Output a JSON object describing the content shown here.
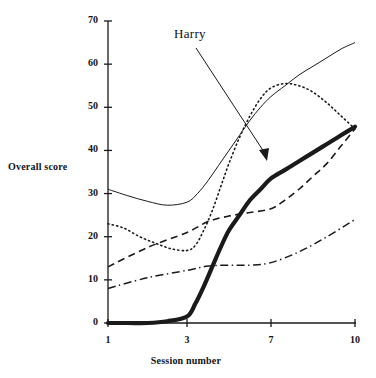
{
  "chart_data": {
    "type": "line",
    "title": "",
    "xlabel": "Session number",
    "ylabel": "Overall score",
    "xlim": [
      1,
      10
    ],
    "ylim": [
      0,
      70
    ],
    "grid": false,
    "legend": "none",
    "xticks": [
      1,
      3,
      7,
      10
    ],
    "xtick_labels": [
      "1",
      "3",
      "7",
      "10"
    ],
    "yticks": [
      0,
      10,
      20,
      30,
      40,
      50,
      60,
      70
    ],
    "ytick_labels": [
      "0",
      "10",
      "20",
      "30",
      "40",
      "50",
      "60",
      "70"
    ],
    "annotations": [
      {
        "text": "Harry",
        "points_to_series": "Harry",
        "x": 6.0,
        "y": 38
      }
    ],
    "series": [
      {
        "name": "Harry",
        "style": "thick-solid",
        "color": "#1a1a1a",
        "x": [
          1,
          1.5,
          2,
          2.5,
          3,
          3.4,
          3.8,
          4.2,
          4.6,
          5,
          5.5,
          6,
          6.5,
          7,
          7.5,
          8,
          8.5,
          9,
          9.5,
          10
        ],
        "y": [
          0,
          0,
          0,
          0.4,
          1.5,
          4.5,
          8.5,
          13,
          17.5,
          21.5,
          25,
          28.5,
          31,
          33.5,
          35.5,
          37.5,
          39.5,
          41.5,
          43.5,
          45.5
        ]
      },
      {
        "name": "series-thin-solid",
        "style": "thin-solid",
        "color": "#1a1a1a",
        "x": [
          1,
          1.5,
          2,
          2.5,
          3,
          3.5,
          4,
          4.5,
          5,
          5.5,
          6,
          6.5,
          7,
          7.5,
          8,
          8.5,
          9,
          9.5,
          10
        ],
        "y": [
          31,
          29.5,
          28.2,
          27.3,
          28,
          30,
          33,
          36.5,
          40,
          43.5,
          47,
          50,
          52.5,
          55,
          57.5,
          59.5,
          61.5,
          63.5,
          65
        ]
      },
      {
        "name": "series-dotted",
        "style": "dotted",
        "color": "#1a1a1a",
        "x": [
          1,
          1.4,
          1.8,
          2.2,
          2.6,
          3,
          3.4,
          3.8,
          4.2,
          4.6,
          5,
          5.5,
          6,
          6.5,
          7,
          7.5,
          8,
          8.5,
          9,
          9.5,
          10
        ],
        "y": [
          23,
          22,
          20,
          18.5,
          17.2,
          16.8,
          18,
          21.5,
          26,
          31.5,
          37,
          43,
          48,
          52,
          54.5,
          55.5,
          55,
          53.5,
          51,
          48,
          45
        ]
      },
      {
        "name": "series-dashed",
        "style": "dashed",
        "color": "#1a1a1a",
        "x": [
          1,
          2,
          3,
          4,
          5,
          6,
          7,
          7.5,
          8,
          8.5,
          9,
          9.5,
          10
        ],
        "y": [
          13,
          17.5,
          21,
          23.5,
          24.8,
          25.6,
          26.5,
          28.5,
          31,
          34,
          37,
          41,
          45
        ]
      },
      {
        "name": "series-dash-dot",
        "style": "dash-dot",
        "color": "#1a1a1a",
        "x": [
          1,
          2,
          3,
          4,
          5,
          6,
          7,
          8,
          9,
          10
        ],
        "y": [
          8,
          10.5,
          12.2,
          13.2,
          13.4,
          13.4,
          14,
          16.5,
          20,
          24
        ]
      }
    ]
  },
  "axis": {
    "y_title": "Overall score",
    "x_title": "Session number"
  },
  "annotation": {
    "harry_label": "Harry"
  },
  "colors": {
    "ink": "#1a1a1a",
    "background": "#ffffff"
  }
}
